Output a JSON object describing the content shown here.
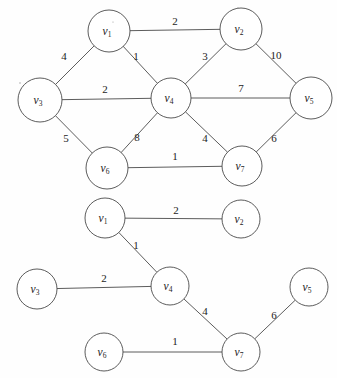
{
  "figure": {
    "title": "",
    "type": "weighted-graph-pair",
    "background_color": "#fefefe",
    "stroke_color": "#4a4a4a",
    "text_color": "#1c1c1c"
  },
  "graphs": [
    {
      "id": "top-graph",
      "name": "weighted-graph-original",
      "nodes": [
        {
          "id": "v1",
          "label": "v",
          "sub": "1",
          "x": 109,
          "y": 31,
          "r": 21
        },
        {
          "id": "v2",
          "label": "v",
          "sub": "2",
          "x": 241,
          "y": 29,
          "r": 21
        },
        {
          "id": "v3",
          "label": "v",
          "sub": "3",
          "x": 40,
          "y": 100,
          "r": 22
        },
        {
          "id": "v4",
          "label": "v",
          "sub": "4",
          "x": 171,
          "y": 98,
          "r": 20
        },
        {
          "id": "v5",
          "label": "v",
          "sub": "5",
          "x": 311,
          "y": 98,
          "r": 21
        },
        {
          "id": "v6",
          "label": "v",
          "sub": "6",
          "x": 107,
          "y": 168,
          "r": 21
        },
        {
          "id": "v7",
          "label": "v",
          "sub": "7",
          "x": 242,
          "y": 166,
          "r": 20
        }
      ],
      "edges": [
        {
          "from": "v1",
          "to": "v2",
          "weight": "2",
          "lx": 175,
          "ly": 22
        },
        {
          "from": "v1",
          "to": "v3",
          "weight": "4",
          "lx": 64,
          "ly": 57
        },
        {
          "from": "v1",
          "to": "v4",
          "weight": "1",
          "lx": 136,
          "ly": 57
        },
        {
          "from": "v2",
          "to": "v4",
          "weight": "3",
          "lx": 205,
          "ly": 57
        },
        {
          "from": "v2",
          "to": "v5",
          "weight": "10",
          "lx": 276,
          "ly": 56
        },
        {
          "from": "v3",
          "to": "v4",
          "weight": "2",
          "lx": 105,
          "ly": 90
        },
        {
          "from": "v3",
          "to": "v6",
          "weight": "5",
          "lx": 66,
          "ly": 139
        },
        {
          "from": "v4",
          "to": "v5",
          "weight": "7",
          "lx": 241,
          "ly": 89
        },
        {
          "from": "v4",
          "to": "v6",
          "weight": "8",
          "lx": 137,
          "ly": 138
        },
        {
          "from": "v4",
          "to": "v7",
          "weight": "4",
          "lx": 205,
          "ly": 139
        },
        {
          "from": "v5",
          "to": "v7",
          "weight": "6",
          "lx": 274,
          "ly": 139
        },
        {
          "from": "v6",
          "to": "v7",
          "weight": "1",
          "lx": 175,
          "ly": 157
        }
      ]
    },
    {
      "id": "bottom-graph",
      "name": "minimum-spanning-tree",
      "nodes": [
        {
          "id": "v1",
          "label": "v",
          "sub": "1",
          "x": 105,
          "y": 218,
          "r": 20
        },
        {
          "id": "v2",
          "label": "v",
          "sub": "2",
          "x": 241,
          "y": 219,
          "r": 19
        },
        {
          "id": "v3",
          "label": "v",
          "sub": "3",
          "x": 37,
          "y": 289,
          "r": 20
        },
        {
          "id": "v4",
          "label": "v",
          "sub": "4",
          "x": 170,
          "y": 286,
          "r": 19
        },
        {
          "id": "v5",
          "label": "v",
          "sub": "5",
          "x": 309,
          "y": 287,
          "r": 19
        },
        {
          "id": "v6",
          "label": "v",
          "sub": "6",
          "x": 104,
          "y": 352,
          "r": 19
        },
        {
          "id": "v7",
          "label": "v",
          "sub": "7",
          "x": 241,
          "y": 352,
          "r": 19
        }
      ],
      "edges": [
        {
          "from": "v1",
          "to": "v2",
          "weight": "2",
          "lx": 176,
          "ly": 211
        },
        {
          "from": "v1",
          "to": "v4",
          "weight": "1",
          "lx": 136,
          "ly": 246
        },
        {
          "from": "v3",
          "to": "v4",
          "weight": "2",
          "lx": 104,
          "ly": 279
        },
        {
          "from": "v4",
          "to": "v7",
          "weight": "4",
          "lx": 205,
          "ly": 312
        },
        {
          "from": "v5",
          "to": "v7",
          "weight": "6",
          "lx": 274,
          "ly": 316
        },
        {
          "from": "v6",
          "to": "v7",
          "weight": "1",
          "lx": 175,
          "ly": 342
        }
      ]
    }
  ]
}
